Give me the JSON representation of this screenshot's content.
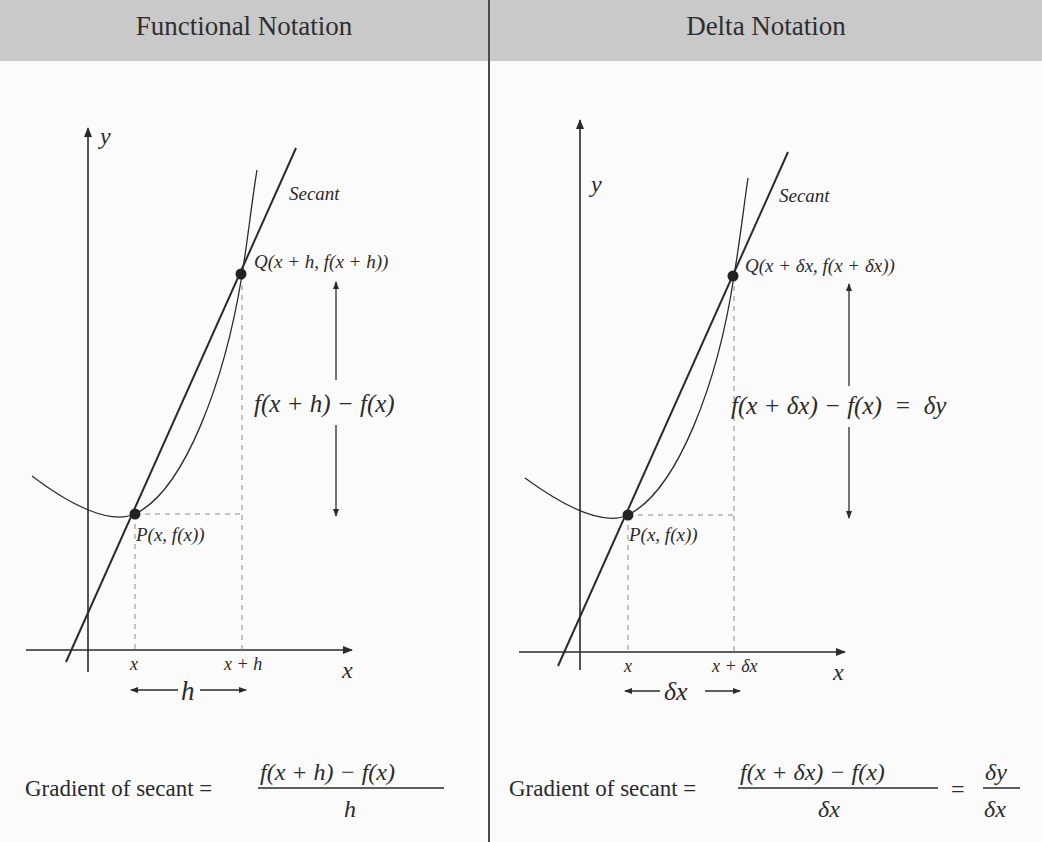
{
  "panels": [
    {
      "title": "Functional Notation",
      "axis_y_label": "y",
      "axis_x_label": "x",
      "secant_label": "Secant",
      "point_q_label": "Q(x + h, f(x + h))",
      "point_p_label": "P(x, f(x))",
      "tick_x": "x",
      "tick_x_plus": "x + h",
      "interval_label": "h",
      "difference_label": "f(x + h) − f(x)",
      "gradient_prefix": "Gradient of secant =",
      "gradient_numerator": "f(x + h) − f(x)",
      "gradient_denominator": "h"
    },
    {
      "title": "Delta Notation",
      "axis_y_label": "y",
      "axis_x_label": "x",
      "secant_label": "Secant",
      "point_q_label": "Q(x + δx, f(x + δx))",
      "point_p_label": "P(x, f(x))",
      "tick_x": "x",
      "tick_x_plus": "x + δx",
      "interval_label": "δx",
      "difference_label": "f(x + δx) − f(x)  =  δy",
      "gradient_prefix": "Gradient of secant =",
      "gradient_numerator": "f(x + δx) − f(x)",
      "gradient_denominator": "δx",
      "gradient_equals": "=",
      "gradient2_numerator": "δy",
      "gradient2_denominator": "δx"
    }
  ],
  "colors": {
    "header_bg": "#c9c9c9",
    "line": "#2a2a2a",
    "dashed": "#8a8a8a",
    "background": "#fbfbfb"
  }
}
